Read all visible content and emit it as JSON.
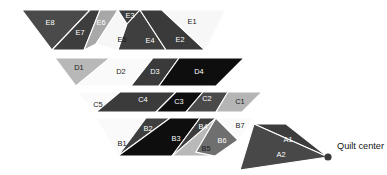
{
  "figure": {
    "background": "#ffffff",
    "width": 387,
    "height": 175,
    "seam_stroke": "#ffffff"
  },
  "center_marker": {
    "label": "Quilt center",
    "dot_color": "#3a3a3a",
    "dot_x": 328,
    "dot_y": 157,
    "dot_r": 3.6,
    "label_x": 337,
    "label_y": 147
  },
  "palette": {
    "white": "#fbfbfb",
    "near_white": "#f2f2f2",
    "light_gray": "#cfcfcf",
    "mid_gray": "#9a9a9a",
    "dark_gray": "#4e4e4e",
    "darker_gray": "#3b3b3b",
    "charcoal": "#2e2e2e",
    "black": "#0d0d0d"
  },
  "rounds": [
    {
      "name": "round-e",
      "pieces": [
        {
          "id": "E8",
          "fill": "#4a4a4a",
          "label_fill": "light",
          "points": "22,10 90,10 52,50",
          "label_x": 50,
          "label_y": 23
        },
        {
          "id": "E7",
          "fill": "#3d3d3d",
          "label_fill": "light",
          "points": "90,10 100,10 84,50 52,50",
          "label_x": 80,
          "label_y": 33
        },
        {
          "id": "E6",
          "fill": "#a8a8a8",
          "label_fill": "light",
          "points": "100,10 118,10 96,44 84,50",
          "label_x": 101,
          "label_y": 23
        },
        {
          "id": "E5",
          "fill": "#f7f7f7",
          "label_fill": "dark",
          "points": "118,10 131,10 118,50 96,44",
          "label_x": 122,
          "label_y": 40
        },
        {
          "id": "E3",
          "fill": "#3d3d3d",
          "label_fill": "light",
          "points": "118,10 140,10 127,24",
          "label_x": 130,
          "label_y": 16
        },
        {
          "id": "E4",
          "fill": "#3f3f3f",
          "label_fill": "light",
          "points": "127,24 140,10 166,50 118,50",
          "label_x": 150,
          "label_y": 41
        },
        {
          "id": "E2",
          "fill": "#3a3a3a",
          "label_fill": "light",
          "points": "140,10 162,10 205,50 166,50",
          "label_x": 180,
          "label_y": 40
        },
        {
          "id": "E1",
          "fill": "#f7f7f7",
          "label_fill": "dark",
          "points": "162,10 226,10 205,50",
          "label_x": 192,
          "label_y": 22
        }
      ]
    },
    {
      "name": "round-d",
      "pieces": [
        {
          "id": "D1",
          "fill": "#b8b8b8",
          "label_fill": "dark",
          "points": "55,58 110,58 76,86",
          "label_x": 79,
          "label_y": 68
        },
        {
          "id": "D2",
          "fill": "#fafafa",
          "label_fill": "dark",
          "points": "110,58 153,58 131,86 76,86",
          "label_x": 121,
          "label_y": 72
        },
        {
          "id": "D3",
          "fill": "#3a3a3a",
          "label_fill": "light",
          "points": "153,58 179,58 159,86 131,86",
          "label_x": 155,
          "label_y": 72
        },
        {
          "id": "D4",
          "fill": "#0e0e0e",
          "label_fill": "light",
          "points": "179,58 244,58 216,86 159,86",
          "label_x": 199,
          "label_y": 72
        }
      ]
    },
    {
      "name": "round-c",
      "pieces": [
        {
          "id": "C5",
          "fill": "#fafafa",
          "label_fill": "dark",
          "points": "76,92 120,92 96,112",
          "label_x": 98,
          "label_y": 105
        },
        {
          "id": "C4",
          "fill": "#3b3b3b",
          "label_fill": "light",
          "points": "120,92 176,92 156,112 96,112",
          "label_x": 143,
          "label_y": 100
        },
        {
          "id": "C3",
          "fill": "#0e0e0e",
          "label_fill": "light",
          "points": "176,92 203,92 186,112 156,112",
          "label_x": 179,
          "label_y": 102
        },
        {
          "id": "C2",
          "fill": "#4a4a4a",
          "label_fill": "light",
          "points": "203,92 228,92 216,112 186,112",
          "label_x": 207,
          "label_y": 99
        },
        {
          "id": "C1",
          "fill": "#b5b5b5",
          "label_fill": "dark",
          "points": "228,92 262,92 242,112 216,112",
          "label_x": 240,
          "label_y": 102
        }
      ]
    },
    {
      "name": "round-b",
      "pieces": [
        {
          "id": "B1",
          "fill": "#fafafa",
          "label_fill": "dark",
          "points": "96,118 146,118 118,156",
          "label_x": 122,
          "label_y": 144
        },
        {
          "id": "B2",
          "fill": "#3f3f3f",
          "label_fill": "light",
          "points": "146,118 170,118 118,156",
          "label_x": 148,
          "label_y": 129
        },
        {
          "id": "B3",
          "fill": "#0e0e0e",
          "label_fill": "light",
          "points": "170,118 200,118 172,156 118,156",
          "label_x": 176,
          "label_y": 139
        },
        {
          "id": "B4",
          "fill": "#3c3c3c",
          "label_fill": "light",
          "points": "200,118 216,118 196,152 172,156",
          "label_x": 203,
          "label_y": 127
        },
        {
          "id": "B5",
          "fill": "#b9b9b9",
          "label_fill": "dark",
          "points": "216,118 196,152 215,156 172,156",
          "label_x": 206,
          "label_y": 149
        },
        {
          "id": "B6",
          "fill": "#6f6f6f",
          "label_fill": "light",
          "points": "216,118 238,140 215,156 196,152",
          "label_x": 222,
          "label_y": 141
        },
        {
          "id": "B7",
          "fill": "#fafafa",
          "label_fill": "dark",
          "points": "216,118 254,118 238,140",
          "label_x": 240,
          "label_y": 126
        }
      ]
    },
    {
      "name": "round-a",
      "pieces": [
        {
          "id": "A1",
          "fill": "#3c3c3c",
          "label_fill": "light",
          "points": "254,124 286,124 328,157",
          "label_x": 288,
          "label_y": 140
        },
        {
          "id": "A2",
          "fill": "#484848",
          "label_fill": "light",
          "points": "254,124 328,157 240,170",
          "label_x": 281,
          "label_y": 155
        }
      ]
    }
  ]
}
